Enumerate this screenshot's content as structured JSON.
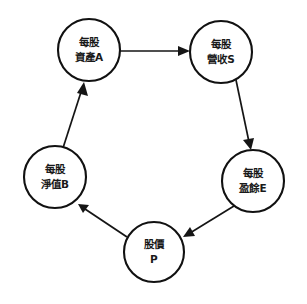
{
  "diagram": {
    "type": "cycle-diagram",
    "background_color": "#ffffff",
    "node_stroke_color": "#111111",
    "edge_color": "#151515",
    "text_color": "#1a1a1a",
    "nodes": [
      {
        "id": "A",
        "name": "assets-per-share",
        "line1": "每股",
        "line2": "資產A",
        "symbol": "A",
        "cx": 89,
        "cy": 50,
        "r": 31
      },
      {
        "id": "S",
        "name": "sales-per-share",
        "line1": "每股",
        "line2": "營收S",
        "symbol": "S",
        "cx": 221,
        "cy": 52,
        "r": 31
      },
      {
        "id": "E",
        "name": "earnings-per-share",
        "line1": "每股",
        "line2": "盈餘E",
        "symbol": "E",
        "cx": 253,
        "cy": 181,
        "r": 31
      },
      {
        "id": "P",
        "name": "stock-price",
        "line1": "股價",
        "line2": "P",
        "symbol": "P",
        "cx": 154,
        "cy": 252,
        "r": 30
      },
      {
        "id": "B",
        "name": "book-value-per-share",
        "line1": "每股",
        "line2": "淨值B",
        "symbol": "B",
        "cx": 55,
        "cy": 177,
        "r": 31
      }
    ],
    "edges": [
      {
        "id": "A-S",
        "name": "arrow-assets-to-sales",
        "from": "A",
        "to": "S",
        "direction": "forward"
      },
      {
        "id": "S-E",
        "name": "arrow-sales-to-earnings",
        "from": "S",
        "to": "E",
        "direction": "forward"
      },
      {
        "id": "E-P",
        "name": "arrow-earnings-to-price",
        "from": "E",
        "to": "P",
        "direction": "forward"
      },
      {
        "id": "P-B",
        "name": "arrow-price-to-bookvalue",
        "from": "P",
        "to": "B",
        "direction": "forward"
      },
      {
        "id": "B-A",
        "name": "arrow-bookvalue-to-assets",
        "from": "B",
        "to": "A",
        "direction": "forward"
      }
    ]
  }
}
